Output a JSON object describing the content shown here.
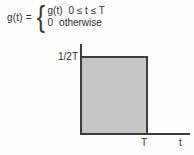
{
  "formula": {
    "lhs": "g(t) =",
    "brace": "{",
    "cases": [
      {
        "value": "g(t)",
        "condition": "0 ≤ t ≤ T"
      },
      {
        "value": "0",
        "condition": "otherwise"
      }
    ]
  },
  "graph": {
    "amplitude_label": "1/2T",
    "x_tick_label": "T",
    "x_axis_label": "t",
    "fill_color": "#c6c6c6",
    "line_color": "#3d3d3d"
  },
  "chart_data": {
    "type": "area",
    "title": "",
    "xlabel": "t",
    "ylabel": "",
    "x_ticks": [
      "T"
    ],
    "y_ticks": [
      "1/2T"
    ],
    "series": [
      {
        "name": "g(t)",
        "points": [
          {
            "t": "0",
            "value": "1/2T"
          },
          {
            "t": "T",
            "value": "1/2T"
          }
        ]
      }
    ]
  }
}
